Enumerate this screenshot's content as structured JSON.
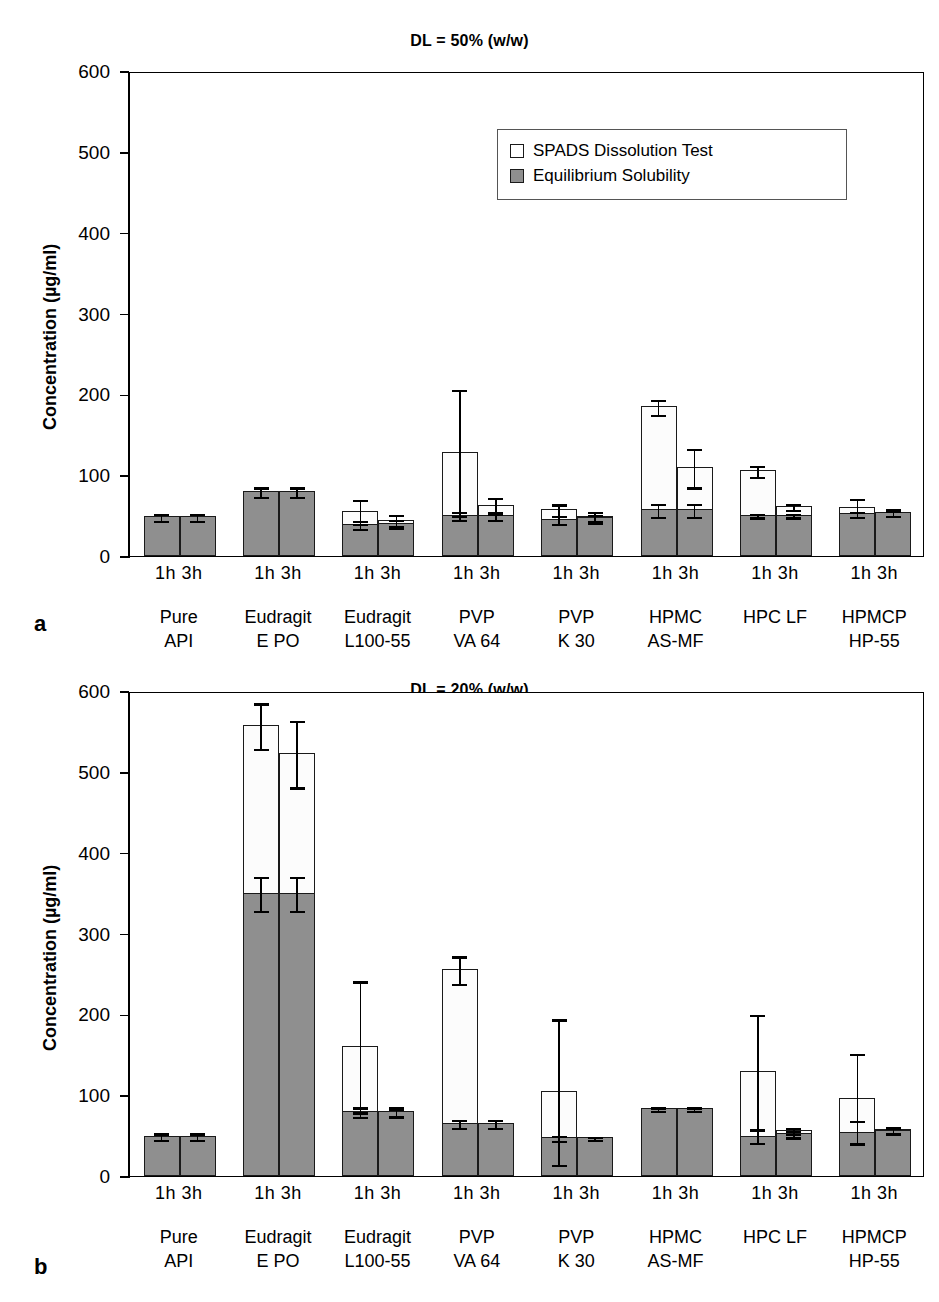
{
  "figure": {
    "ylabel": "Concentration (µg/ml)",
    "ytick_labels": [
      "600",
      "500",
      "400",
      "300",
      "200",
      "100",
      "0"
    ],
    "legend": {
      "items": [
        {
          "label": "SPADS Dissolution Test",
          "swatch": "white"
        },
        {
          "label": "Equilibrium Solubility",
          "swatch": "gray"
        }
      ]
    },
    "panels": [
      {
        "letter": "a",
        "title": "DL = 50% (w/w)"
      },
      {
        "letter": "b",
        "title": "DL = 20% (w/w)"
      }
    ]
  },
  "chart_data": [
    {
      "type": "bar",
      "panel": "a",
      "title": "DL = 50% (w/w)",
      "xlabel": "",
      "ylabel": "Concentration (µg/ml)",
      "ylim": [
        0,
        600
      ],
      "yticks": [
        0,
        100,
        200,
        300,
        400,
        500,
        600
      ],
      "grid": false,
      "legend_position": "upper right",
      "categories": [
        "Pure API",
        "Eudragit E PO",
        "Eudragit L100-55",
        "PVP VA 64",
        "PVP K 30",
        "HPMC AS-MF",
        "HPC LF",
        "HPMCP HP-55"
      ],
      "timepoints": [
        "1h",
        "3h"
      ],
      "series": [
        {
          "name": "SPADS Dissolution Test",
          "color": "#ffffff",
          "values": [
            {
              "category": "Pure API",
              "1h": 49,
              "3h": 49,
              "1h_err": 4,
              "3h_err": 4
            },
            {
              "category": "Eudragit E PO",
              "1h": 80,
              "3h": 80,
              "1h_err": 6,
              "3h_err": 6
            },
            {
              "category": "Eudragit L100-55",
              "1h": 56,
              "3h": 45,
              "1h_err": 15,
              "3h_err": 7
            },
            {
              "category": "PVP VA 64",
              "1h": 129,
              "3h": 63,
              "1h_err": 78,
              "3h_err": 10
            },
            {
              "category": "PVP K 30",
              "1h": 58,
              "3h": 49,
              "1h_err": 7,
              "3h_err": 7
            },
            {
              "category": "HPMC AS-MF",
              "1h": 185,
              "3h": 110,
              "1h_err": 9,
              "3h_err": 24
            },
            {
              "category": "HPC LF",
              "1h": 106,
              "3h": 62,
              "1h_err": 7,
              "3h_err": 4
            },
            {
              "category": "HPMCP HP-55",
              "1h": 61,
              "3h": 55,
              "1h_err": 11,
              "3h_err": 4
            }
          ]
        },
        {
          "name": "Equilibrium Solubility",
          "color": "#8f8f8f",
          "values": [
            {
              "category": "Pure API",
              "1h": 49,
              "3h": 49,
              "1h_err": 4,
              "3h_err": 4
            },
            {
              "category": "Eudragit E PO",
              "1h": 80,
              "3h": 80,
              "1h_err": 6,
              "3h_err": 6
            },
            {
              "category": "Eudragit L100-55",
              "1h": 40,
              "3h": 41,
              "1h_err": 5,
              "3h_err": 5
            },
            {
              "category": "PVP VA 64",
              "1h": 51,
              "3h": 51,
              "1h_err": 5,
              "3h_err": 5
            },
            {
              "category": "PVP K 30",
              "1h": 46,
              "3h": 48,
              "1h_err": 5,
              "3h_err": 4
            },
            {
              "category": "HPMC AS-MF",
              "1h": 58,
              "3h": 58,
              "1h_err": 8,
              "3h_err": 8
            },
            {
              "category": "HPC LF",
              "1h": 51,
              "3h": 51,
              "1h_err": 2,
              "3h_err": 2
            },
            {
              "category": "HPMCP HP-55",
              "1h": 53,
              "3h": 54,
              "1h_err": 3,
              "3h_err": 3
            }
          ]
        }
      ]
    },
    {
      "type": "bar",
      "panel": "b",
      "title": "DL = 20% (w/w)",
      "xlabel": "",
      "ylabel": "Concentration (µg/ml)",
      "ylim": [
        0,
        600
      ],
      "yticks": [
        0,
        100,
        200,
        300,
        400,
        500,
        600
      ],
      "grid": false,
      "legend_position": "none",
      "categories": [
        "Pure API",
        "Eudragit E PO",
        "Eudragit L100-55",
        "PVP VA 64",
        "PVP K 30",
        "HPMC AS-MF",
        "HPC LF",
        "HPMCP HP-55"
      ],
      "timepoints": [
        "1h",
        "3h"
      ],
      "series": [
        {
          "name": "SPADS Dissolution Test",
          "color": "#ffffff",
          "values": [
            {
              "category": "Pure API",
              "1h": 50,
              "3h": 50,
              "1h_err": 4,
              "3h_err": 4
            },
            {
              "category": "Eudragit E PO",
              "1h": 558,
              "3h": 523,
              "1h_err": 28,
              "3h_err": 41
            },
            {
              "category": "Eudragit L100-55",
              "1h": 161,
              "3h": 80,
              "1h_err": 81,
              "3h_err": 4
            },
            {
              "category": "PVP VA 64",
              "1h": 256,
              "3h": 66,
              "1h_err": 17,
              "3h_err": 5
            },
            {
              "category": "PVP K 30",
              "1h": 105,
              "3h": 48,
              "1h_err": 90,
              "3h_err": 2
            },
            {
              "category": "HPMC AS-MF",
              "1h": 84,
              "3h": 84,
              "1h_err": 2,
              "3h_err": 2
            },
            {
              "category": "HPC LF",
              "1h": 130,
              "3h": 57,
              "1h_err": 71,
              "3h_err": 4
            },
            {
              "category": "HPMCP HP-55",
              "1h": 97,
              "3h": 58,
              "1h_err": 55,
              "3h_err": 4
            }
          ]
        },
        {
          "name": "Equilibrium Solubility",
          "color": "#8f8f8f",
          "values": [
            {
              "category": "Pure API",
              "1h": 50,
              "3h": 50,
              "1h_err": 4,
              "3h_err": 4
            },
            {
              "category": "Eudragit E PO",
              "1h": 350,
              "3h": 350,
              "1h_err": 21,
              "3h_err": 21
            },
            {
              "category": "Eudragit L100-55",
              "1h": 80,
              "3h": 80,
              "1h_err": 6,
              "3h_err": 6
            },
            {
              "category": "PVP VA 64",
              "1h": 66,
              "3h": 66,
              "1h_err": 5,
              "3h_err": 5
            },
            {
              "category": "PVP K 30",
              "1h": 48,
              "3h": 48,
              "1h_err": 3,
              "3h_err": 2
            },
            {
              "category": "HPMC AS-MF",
              "1h": 84,
              "3h": 84,
              "1h_err": 2,
              "3h_err": 2
            },
            {
              "category": "HPC LF",
              "1h": 50,
              "3h": 53,
              "1h_err": 8,
              "3h_err": 4
            },
            {
              "category": "HPMCP HP-55",
              "1h": 55,
              "3h": 57,
              "1h_err": 14,
              "3h_err": 4
            }
          ]
        }
      ]
    }
  ]
}
